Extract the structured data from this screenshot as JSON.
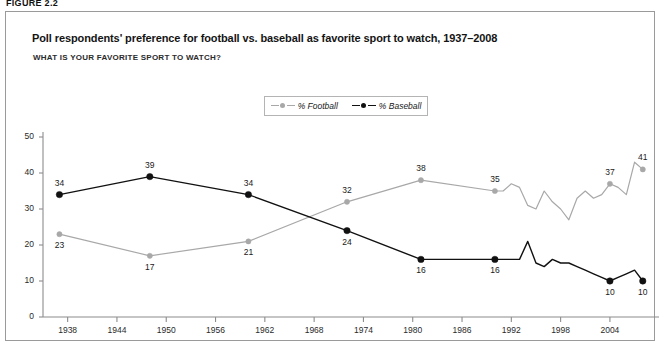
{
  "figure": {
    "label": "FIGURE 2.2"
  },
  "header": {
    "title": "Poll respondents' preference for football vs. baseball as favorite sport to watch, 1937–2008",
    "subtitle": "WHAT IS YOUR FAVORITE SPORT TO WATCH?"
  },
  "colors": {
    "football": "#a8a8a8",
    "baseball": "#111111",
    "axis": "#8c8c8c",
    "border": "#9a9a9a",
    "text": "#1a1a1a"
  },
  "chart_data": {
    "type": "line",
    "title": "Poll respondents' preference for football vs. baseball as favorite sport to watch, 1937–2008",
    "subtitle": "WHAT IS YOUR FAVORITE SPORT TO WATCH?",
    "xlabel": "",
    "ylabel": "",
    "xlim": [
      1935,
      2009
    ],
    "ylim": [
      0,
      50
    ],
    "grid": false,
    "legend_position": "top-center",
    "xticks": [
      1938,
      1944,
      1950,
      1956,
      1962,
      1968,
      1974,
      1980,
      1986,
      1992,
      1998,
      2004
    ],
    "yticks": [
      0,
      10,
      20,
      30,
      40,
      50
    ],
    "series": [
      {
        "name": "% Football",
        "color": "#a8a8a8",
        "x": [
          1937,
          1948,
          1960,
          1972,
          1981,
          1990,
          1991,
          1992,
          1993,
          1994,
          1995,
          1996,
          1997,
          1998,
          1999,
          2000,
          2001,
          2002,
          2003,
          2004,
          2005,
          2006,
          2007,
          2008
        ],
        "y": [
          23,
          17,
          21,
          32,
          38,
          35,
          35,
          37,
          36,
          31,
          30,
          35,
          32,
          30,
          27,
          33,
          35,
          33,
          34,
          37,
          36,
          34,
          43,
          41
        ]
      },
      {
        "name": "% Baseball",
        "color": "#111111",
        "x": [
          1937,
          1948,
          1960,
          1972,
          1981,
          1990,
          1991,
          1992,
          1993,
          1994,
          1995,
          1996,
          1997,
          1998,
          1999,
          2000,
          2001,
          2002,
          2003,
          2004,
          2005,
          2006,
          2007,
          2008
        ],
        "y": [
          34,
          39,
          34,
          24,
          16,
          16,
          16,
          16,
          16,
          21,
          15,
          14,
          16,
          15,
          15,
          14,
          13,
          12,
          11,
          10,
          11,
          12,
          13,
          10
        ]
      }
    ],
    "point_labels": [
      {
        "series": "% Baseball",
        "x": 1937,
        "y": 34,
        "text": "34"
      },
      {
        "series": "% Baseball",
        "x": 1948,
        "y": 39,
        "text": "39"
      },
      {
        "series": "% Baseball",
        "x": 1960,
        "y": 34,
        "text": "34"
      },
      {
        "series": "% Baseball",
        "x": 1972,
        "y": 24,
        "text": "24"
      },
      {
        "series": "% Baseball",
        "x": 1981,
        "y": 16,
        "text": "16"
      },
      {
        "series": "% Baseball",
        "x": 1990,
        "y": 16,
        "text": "16"
      },
      {
        "series": "% Baseball",
        "x": 2004,
        "y": 10,
        "text": "10"
      },
      {
        "series": "% Baseball",
        "x": 2008,
        "y": 10,
        "text": "10"
      },
      {
        "series": "% Football",
        "x": 1937,
        "y": 23,
        "text": "23"
      },
      {
        "series": "% Football",
        "x": 1948,
        "y": 17,
        "text": "17"
      },
      {
        "series": "% Football",
        "x": 1960,
        "y": 21,
        "text": "21"
      },
      {
        "series": "% Football",
        "x": 1972,
        "y": 32,
        "text": "32"
      },
      {
        "series": "% Football",
        "x": 1981,
        "y": 38,
        "text": "38"
      },
      {
        "series": "% Football",
        "x": 1990,
        "y": 35,
        "text": "35"
      },
      {
        "series": "% Football",
        "x": 2004,
        "y": 37,
        "text": "37"
      },
      {
        "series": "% Football",
        "x": 2008,
        "y": 41,
        "text": "41"
      }
    ],
    "legend": [
      {
        "label": "% Football",
        "color": "#a8a8a8"
      },
      {
        "label": "% Baseball",
        "color": "#111111"
      }
    ]
  }
}
